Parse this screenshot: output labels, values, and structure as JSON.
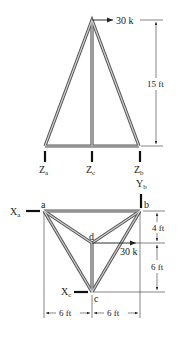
{
  "elevation": {
    "load": {
      "label": "30 k",
      "direction": "right"
    },
    "height_dim": {
      "label": "15 ft"
    },
    "supports": [
      {
        "id": "za",
        "label": "Z",
        "sub": "a"
      },
      {
        "id": "zc",
        "label": "Z",
        "sub": "c"
      },
      {
        "id": "zb",
        "label": "Z",
        "sub": "b"
      }
    ]
  },
  "plan": {
    "nodes": [
      {
        "id": "a",
        "label": "a"
      },
      {
        "id": "b",
        "label": "b"
      },
      {
        "id": "c",
        "label": "c"
      },
      {
        "id": "d",
        "label": "d"
      }
    ],
    "reactions": [
      {
        "id": "xa",
        "label": "X",
        "sub": "a"
      },
      {
        "id": "yb",
        "label": "Y",
        "sub": "b"
      },
      {
        "id": "xc",
        "label": "X",
        "sub": "c"
      }
    ],
    "load": {
      "label": "30 k",
      "direction": "right"
    },
    "dims": {
      "vertical_top": "4 ft",
      "vertical_bottom": "6 ft",
      "horizontal_left": "6 ft",
      "horizontal_right": "6 ft"
    }
  }
}
